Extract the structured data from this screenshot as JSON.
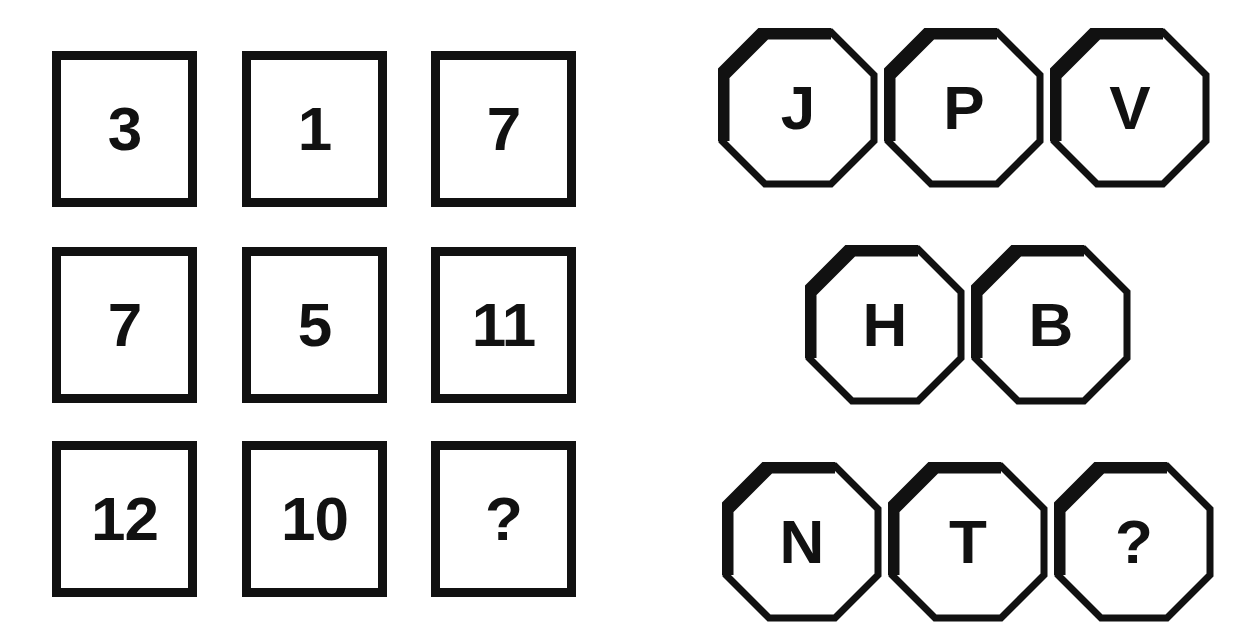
{
  "puzzle": {
    "background_color": "#ffffff",
    "ink_color": "#111111",
    "missing_marker": "?",
    "left_panel": {
      "shape": "square",
      "rows": [
        {
          "cells": [
            {
              "value": "3"
            },
            {
              "value": "1"
            },
            {
              "value": "7"
            }
          ]
        },
        {
          "cells": [
            {
              "value": "7"
            },
            {
              "value": "5"
            },
            {
              "value": "11"
            }
          ]
        },
        {
          "cells": [
            {
              "value": "12"
            },
            {
              "value": "10"
            },
            {
              "value": "?"
            }
          ]
        }
      ]
    },
    "right_panel": {
      "shape": "octagon",
      "rows": [
        {
          "cells": [
            {
              "value": "J"
            },
            {
              "value": "P"
            },
            {
              "value": "V"
            }
          ]
        },
        {
          "cells": [
            {
              "value": "H"
            },
            {
              "value": "B"
            }
          ]
        },
        {
          "cells": [
            {
              "value": "N"
            },
            {
              "value": "T"
            },
            {
              "value": "?"
            }
          ]
        }
      ]
    }
  }
}
